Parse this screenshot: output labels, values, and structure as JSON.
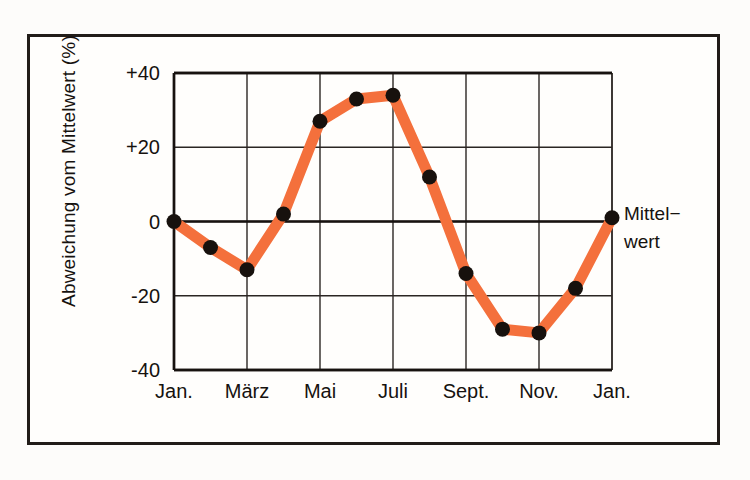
{
  "chart_data": {
    "type": "line",
    "title": "",
    "subtitle": "",
    "xlabel": "",
    "ylabel": "Abweichung vom Mittelwert (%)",
    "ylim": [
      -40,
      40
    ],
    "yticks": [
      "+40",
      "+20",
      "0",
      "-20",
      "-40"
    ],
    "ytick_values": [
      40,
      20,
      0,
      -20,
      -40
    ],
    "xticks": [
      "Jan.",
      "März",
      "Mai",
      "Juli",
      "Sept.",
      "Nov.",
      "Jan."
    ],
    "xtick_values": [
      0,
      2,
      4,
      6,
      8,
      10,
      12
    ],
    "grid": true,
    "legend": "none",
    "annotations": [
      {
        "name": "mittelwert-label",
        "line1": "Mittel−",
        "line2": "wert",
        "x": 12,
        "y": 0
      }
    ],
    "series": [
      {
        "name": "Abweichung vom Mittelwert",
        "color": "#f4703c",
        "marker_color": "#17110d",
        "x": [
          0,
          1,
          2,
          3,
          4,
          5,
          6,
          7,
          8,
          9,
          10,
          11,
          12
        ],
        "values": [
          0,
          -7,
          -13,
          2,
          27,
          33,
          34,
          12,
          -14,
          -29,
          -30,
          -18,
          1
        ]
      }
    ]
  },
  "colors": {
    "accent": "#f4703c",
    "marker": "#17110d",
    "axis": "#17120f",
    "grid": "#2b2623",
    "frame": "#211c18",
    "background": "#fffefc"
  }
}
